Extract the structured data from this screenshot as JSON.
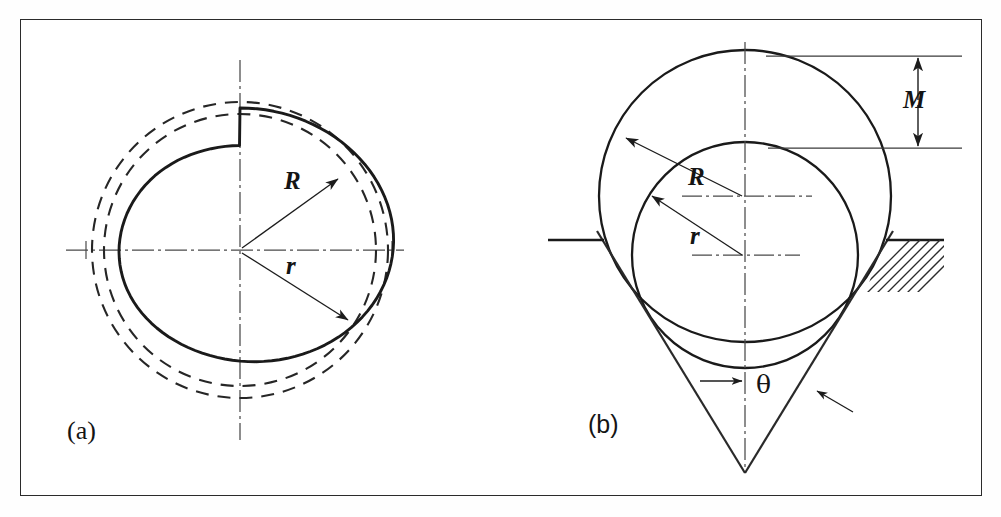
{
  "figure": {
    "background_color": "#ffffff",
    "line_color": "#1c1c1c",
    "frame": {
      "border_color": "#2b2b2b",
      "border_width_px": 1.4
    }
  },
  "panels": [
    {
      "tag": "(a)",
      "name": "trilobe-constant-diameter",
      "description": "Three-lobed profile bounded by inscribed and circumscribed dashed circles",
      "center": {
        "x": 240,
        "y": 250
      },
      "labels": [
        {
          "symbol": "R",
          "style": "italic",
          "meaning": "circumscribed-radius"
        },
        {
          "symbol": "r",
          "style": "italic",
          "meaning": "inscribed-radius"
        }
      ],
      "geometry": {
        "inner_dashed_radius": 137,
        "outer_dashed_radius": 148,
        "lobe_count": 3,
        "lobe_mean_radius": 142.5,
        "lobe_amplitude": 5.5
      },
      "centerlines": {
        "horizontal": true,
        "vertical": true,
        "style": "dash-dot"
      }
    },
    {
      "tag": "(b)",
      "name": "two-balls-in-v-groove",
      "description": "Large and small circle seated in a V groove, M is the height difference",
      "labels": [
        {
          "symbol": "R",
          "style": "italic",
          "meaning": "large-ball-radius"
        },
        {
          "symbol": "r",
          "style": "italic",
          "meaning": "small-ball-radius"
        },
        {
          "symbol": "M",
          "style": "italic",
          "meaning": "measured-height-difference"
        },
        {
          "symbol": "θ",
          "style": "upright",
          "meaning": "included-cone-angle"
        }
      ],
      "geometry": {
        "big_circle": {
          "cx": 745,
          "cy": 196,
          "r": 146
        },
        "small_circle": {
          "cx": 745,
          "cy": 255,
          "r": 113
        },
        "cone_apex": {
          "x": 745,
          "y": 473
        },
        "half_angle_deg": 26,
        "ground_line_y": 240
      },
      "hatching": {
        "blocks": 2,
        "angle_deg": 45,
        "side": "both"
      },
      "dimension_M": {
        "top_y": 56,
        "bottom_y": 148,
        "arrow_x": 918,
        "extension_from_x": 770,
        "extension_to_x": 962
      }
    }
  ],
  "symbols": {
    "R": "R",
    "r": "r",
    "M": "M",
    "theta": "θ",
    "tag_a": "(a)",
    "tag_b": "(b)"
  },
  "icons": {
    "arrowhead": "filled-triangle-arrowhead",
    "centerline": "dash-dot-centerline",
    "hatch": "section-hatch-lines"
  }
}
